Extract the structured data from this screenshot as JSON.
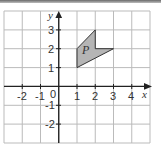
{
  "diagram": {
    "type": "coordinate-grid",
    "x_axis": {
      "label": "x",
      "range": [
        -3,
        5
      ],
      "tick_labels": [
        "-2",
        "-1",
        "0",
        "1",
        "2",
        "3",
        "4"
      ]
    },
    "y_axis": {
      "label": "y",
      "range": [
        -3,
        4
      ],
      "tick_labels": [
        "3",
        "2",
        "1",
        "-1",
        "-2"
      ]
    },
    "shape": {
      "label": "P",
      "vertices": [
        [
          1,
          1
        ],
        [
          1,
          2
        ],
        [
          2,
          3
        ],
        [
          2,
          2
        ],
        [
          3,
          2
        ]
      ],
      "fill": "#b5b5b5",
      "stroke": "#333333"
    },
    "colors": {
      "grid": "#bbbbbb",
      "axis": "#222222",
      "background": "#ffffff"
    }
  }
}
